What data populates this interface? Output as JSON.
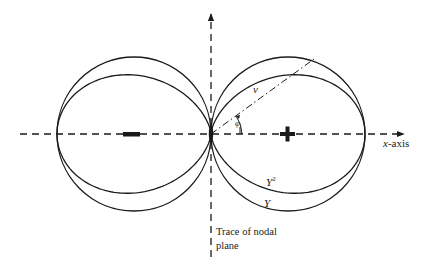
{
  "diagram": {
    "title": "",
    "labels": {
      "x_axis": "x-axis",
      "x_axis_var": "x",
      "x_axis_suffix": "-axis",
      "v": "v",
      "phi": "φ",
      "y_squared_base": "Y",
      "y_squared_exp": "2",
      "y": "Y",
      "nodal_line1": "Trace of nodal",
      "nodal_line2": "plane"
    },
    "signs": {
      "left_lobe": "minus",
      "right_lobe": "plus"
    },
    "curves": [
      {
        "name": "Y",
        "description": "outer lobes (circles)"
      },
      {
        "name": "Y^2",
        "description": "inner flattened lobes"
      }
    ],
    "colors": {
      "ink": "#1a1a1a",
      "background": "#ffffff"
    }
  }
}
